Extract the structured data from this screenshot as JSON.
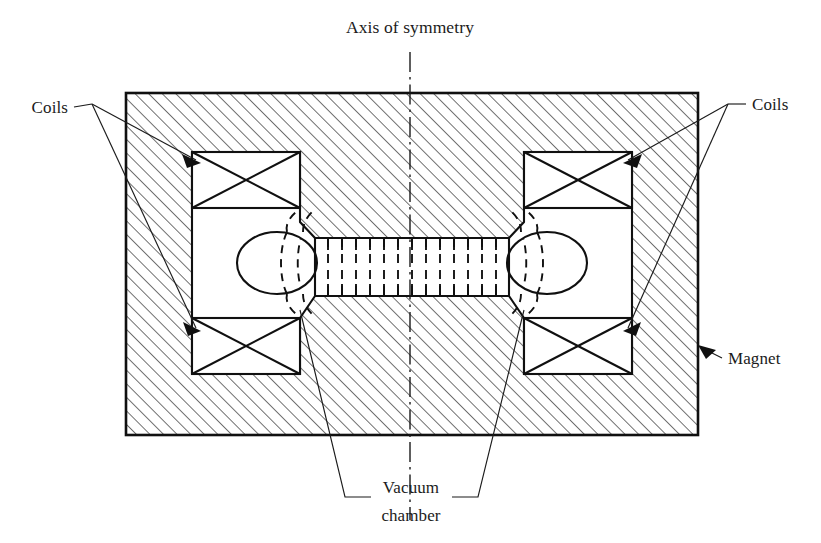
{
  "figure": {
    "title_label": "Axis of symmetry",
    "background_color": "#ffffff",
    "line_color": "#101010",
    "hatch_color": "#1d1d1d",
    "width": 821,
    "height": 543
  },
  "labels": {
    "axis_of_symmetry": "Axis of symmetry",
    "coils_left": "Coils",
    "coils_right": "Coils",
    "magnet": "Magnet",
    "vacuum_line1": "Vacuum",
    "vacuum_line2": "chamber"
  },
  "components": {
    "magnet": {
      "name": "Magnet",
      "shape": "rectangle",
      "hatched": true,
      "x": 126,
      "y": 93,
      "width": 572,
      "height": 342
    },
    "coils": [
      {
        "position": "top-left",
        "x": 192,
        "y": 152,
        "width": 108,
        "height": 56
      },
      {
        "position": "bottom-left",
        "x": 192,
        "y": 318,
        "width": 108,
        "height": 56
      },
      {
        "position": "top-right",
        "x": 524,
        "y": 152,
        "width": 108,
        "height": 56
      },
      {
        "position": "bottom-right",
        "x": 524,
        "y": 318,
        "width": 108,
        "height": 56
      }
    ],
    "vacuum_chamber": {
      "name": "Vacuum chamber",
      "tube": {
        "x": 315,
        "y": 238,
        "width": 194,
        "height": 58,
        "rib_count": 13
      },
      "end_bulbs": [
        {
          "position": "left",
          "cx": 277,
          "cy": 263,
          "rx": 40,
          "ry": 31
        },
        {
          "position": "right",
          "cx": 547,
          "cy": 263,
          "rx": 40,
          "ry": 31
        }
      ]
    },
    "axis_of_symmetry": {
      "x": 410,
      "y_top": 52,
      "y_bottom": 520,
      "style": "dash-dot"
    }
  }
}
